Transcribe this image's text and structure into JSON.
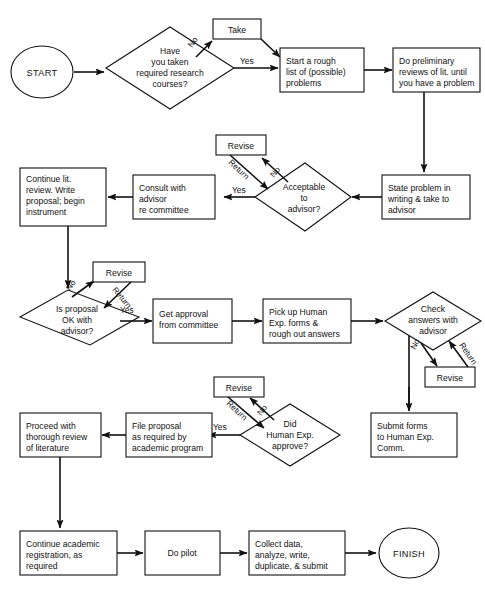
{
  "diagram": {
    "background": "#ffffff",
    "line_color": "#111111",
    "terminators": {
      "start": "START",
      "finish": "FINISH"
    },
    "nodes": {
      "start": {
        "shape": "ellipse",
        "label": "START"
      },
      "have_courses": {
        "shape": "diamond",
        "lines": [
          "Have",
          "you taken",
          "required research",
          "courses?"
        ]
      },
      "take": {
        "shape": "box",
        "lines": [
          "Take"
        ]
      },
      "rough_list": {
        "shape": "box",
        "lines": [
          "Start a rough",
          "list of (possible)",
          "problems"
        ]
      },
      "prelim": {
        "shape": "box",
        "lines": [
          "Do preliminary",
          "reviews of lit. until",
          "you have a problem"
        ]
      },
      "state_problem": {
        "shape": "box",
        "lines": [
          "State problem in",
          "writing & take to",
          "advisor"
        ]
      },
      "acceptable": {
        "shape": "diamond",
        "lines": [
          "Acceptable",
          "to",
          "advisor?"
        ]
      },
      "revise1": {
        "shape": "box",
        "lines": [
          "Revise"
        ]
      },
      "consult": {
        "shape": "box",
        "lines": [
          "Consult with",
          "advisor",
          "re committee"
        ]
      },
      "continue_lit": {
        "shape": "box",
        "lines": [
          "Continue lit.",
          "review.  Write",
          "proposal; begin",
          "instrument"
        ]
      },
      "proposal_ok": {
        "shape": "diamond",
        "lines": [
          "Is proposal",
          "OK with",
          "advisor?"
        ]
      },
      "revise2": {
        "shape": "box",
        "lines": [
          "Revise"
        ]
      },
      "get_approval": {
        "shape": "box",
        "lines": [
          "Get approval",
          "from committee"
        ]
      },
      "pickup_forms": {
        "shape": "box",
        "lines": [
          "Pick up Human",
          "Exp. forms &",
          "rough out answers"
        ]
      },
      "check_answers": {
        "shape": "diamond",
        "lines": [
          "Check",
          "answers with",
          "advisor"
        ]
      },
      "revise3": {
        "shape": "box",
        "lines": [
          "Revise"
        ]
      },
      "submit_forms": {
        "shape": "box",
        "lines": [
          "Submit forms",
          "to Human Exp.",
          "Comm."
        ]
      },
      "did_approve": {
        "shape": "diamond",
        "lines": [
          "Did",
          "Human Exp.",
          "approve?"
        ]
      },
      "revise4": {
        "shape": "box",
        "lines": [
          "Revise"
        ]
      },
      "file_proposal": {
        "shape": "box",
        "lines": [
          "File proposal",
          "as required by",
          "academic program"
        ]
      },
      "proceed_review": {
        "shape": "box",
        "lines": [
          "Proceed with",
          "thorough review",
          "of literature"
        ]
      },
      "continue_reg": {
        "shape": "box",
        "lines": [
          "Continue academic",
          "registration, as",
          "required"
        ]
      },
      "do_pilot": {
        "shape": "box",
        "lines": [
          "Do pilot"
        ]
      },
      "collect_data": {
        "shape": "box",
        "lines": [
          "Collect data,",
          "analyze, write,",
          "duplicate, & submit"
        ]
      },
      "finish": {
        "shape": "ellipse",
        "label": "FINISH"
      }
    },
    "edge_labels": {
      "no1": "No",
      "yes1": "Yes",
      "revise_top": "Revise",
      "no2": "No",
      "return2": "Return",
      "yes2": "Yes",
      "no3": "No",
      "return3": "Return",
      "yes3": "Yes",
      "no4": "No",
      "return4": "Return",
      "no5": "No",
      "return5": "Return",
      "yes5": "Yes"
    }
  }
}
